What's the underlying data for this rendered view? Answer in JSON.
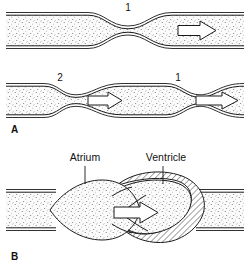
{
  "figure": {
    "background_color": "#ffffff",
    "ink_color": "#1a1a1a"
  },
  "panels": [
    {
      "id": "A",
      "letter": "A",
      "description": "Tube with peristaltic constriction waves and flow arrows",
      "rows": [
        {
          "id": "A-row-1",
          "labels": [
            {
              "text": "1",
              "role": "constriction-marker"
            }
          ],
          "arrows": [
            {
              "direction": "right",
              "role": "flow-arrow"
            }
          ]
        },
        {
          "id": "A-row-2",
          "labels": [
            {
              "text": "2",
              "role": "constriction-marker"
            },
            {
              "text": "1",
              "role": "constriction-marker"
            }
          ],
          "arrows": [
            {
              "direction": "right",
              "role": "flow-arrow"
            },
            {
              "direction": "right",
              "role": "flow-arrow"
            }
          ]
        }
      ]
    },
    {
      "id": "B",
      "letter": "B",
      "description": "Atrium and ventricle chambers with valve and ejection arrow",
      "labels": [
        {
          "text": "Atrium",
          "role": "chamber-label"
        },
        {
          "text": "Ventricle",
          "role": "chamber-label"
        }
      ],
      "arrows": [
        {
          "direction": "right",
          "role": "ejection-arrow"
        }
      ]
    }
  ],
  "colors": {
    "stroke": "#1a1a1a",
    "lumen_fill": "#f7f7f7",
    "stipple_dot": "#6b6b6b",
    "hatch_line": "#1a1a1a",
    "arrow_fill": "#ffffff"
  }
}
